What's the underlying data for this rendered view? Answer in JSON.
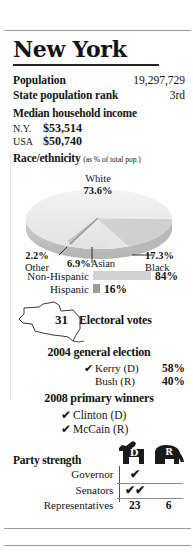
{
  "title": "New York",
  "stats": [
    {
      "label": "Population",
      "value": "19,297,729"
    },
    {
      "label": "State population rank",
      "value": "3rd"
    }
  ],
  "income": {
    "heading": "Median household income",
    "rows": [
      {
        "label": "N.Y.",
        "amount": "$53,514",
        "value": 53514,
        "bar_width": 86,
        "color": "#d4d4d4"
      },
      {
        "label": "USA",
        "amount": "$50,740",
        "value": 50740,
        "bar_width": 82,
        "color": "#a8a8a8"
      }
    ]
  },
  "race": {
    "heading": "Race/ethnicity",
    "note": "(as % of total pop.)",
    "segments": [
      {
        "name": "White",
        "pct": "73.6%"
      },
      {
        "name": "Black",
        "pct": "17.3%"
      },
      {
        "name": "Asian",
        "pct": "6.9%"
      },
      {
        "name": "Other",
        "pct": "2.2%"
      }
    ]
  },
  "hispanic": {
    "rows": [
      {
        "label": "Non-Hispanic",
        "value": "84%",
        "bar_width": 58,
        "color": "#d2d2d2"
      },
      {
        "label": "Hispanic",
        "value": "16%",
        "bar_width": 7,
        "color": "#9c9c9c"
      }
    ]
  },
  "electoral": {
    "number": "31",
    "label": "Electoral votes"
  },
  "general_election": {
    "heading": "2004 general election",
    "candidates": [
      {
        "check": "✔",
        "name": "Kerry (D)",
        "pct": "58%"
      },
      {
        "check": "",
        "name": "Bush (R)",
        "pct": "40%"
      }
    ]
  },
  "primary": {
    "heading": "2008 primary winners",
    "winners": [
      {
        "check": "✔",
        "name": "Clinton (D)"
      },
      {
        "check": "✔",
        "name": "McCain (R)"
      }
    ]
  },
  "party_strength": {
    "title": "Party strength",
    "columns": [
      "D",
      "R"
    ],
    "rows": [
      {
        "label": "Governor",
        "d": "✔",
        "r": ""
      },
      {
        "label": "Senators",
        "d": "✔✔",
        "r": ""
      },
      {
        "label": "Representatives",
        "d": "23",
        "r": "6"
      }
    ]
  }
}
